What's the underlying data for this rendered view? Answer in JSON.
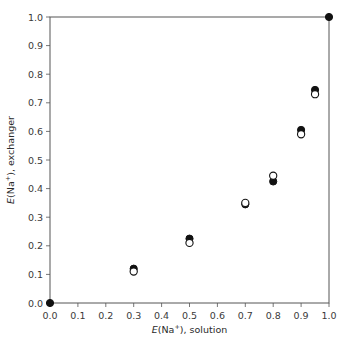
{
  "chart_data": {
    "type": "scatter",
    "title": "",
    "xlabel": "E(Na⁺), solution",
    "ylabel": "E(Na⁺), exchanger",
    "xlabel_parts": {
      "italic": "E",
      "rest": "(Na",
      "sup": "+",
      "tail": "), solution"
    },
    "ylabel_parts": {
      "italic": "E",
      "rest": "(Na",
      "sup": "+",
      "tail": "), exchanger"
    },
    "xlim": [
      0,
      1
    ],
    "ylim": [
      0,
      1
    ],
    "xticks": [
      "0.0",
      "0.1",
      "0.2",
      "0.3",
      "0.4",
      "0.5",
      "0.6",
      "0.7",
      "0.8",
      "0.9",
      "1.0"
    ],
    "yticks": [
      "0.0",
      "0.1",
      "0.2",
      "0.3",
      "0.4",
      "0.5",
      "0.6",
      "0.7",
      "0.8",
      "0.9",
      "1.0"
    ],
    "grid": false,
    "legend": null,
    "series": [
      {
        "name": "filled markers",
        "marker": "filled-circle",
        "color": "#111111",
        "x": [
          0.0,
          0.3,
          0.5,
          0.7,
          0.8,
          0.9,
          0.95,
          1.0
        ],
        "y": [
          0.0,
          0.12,
          0.225,
          0.345,
          0.425,
          0.605,
          0.745,
          1.0
        ]
      },
      {
        "name": "open markers",
        "marker": "open-circle",
        "color": "#111111",
        "x": [
          0.3,
          0.5,
          0.7,
          0.8,
          0.9,
          0.95
        ],
        "y": [
          0.11,
          0.21,
          0.35,
          0.445,
          0.59,
          0.73
        ]
      }
    ]
  }
}
